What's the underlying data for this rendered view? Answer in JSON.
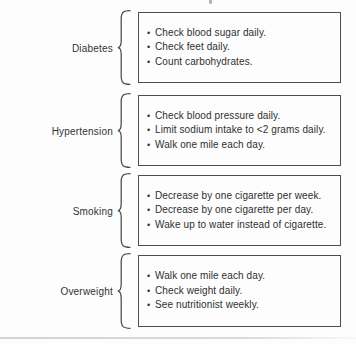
{
  "figure": {
    "sections": [
      {
        "label": "Diabetes",
        "items": [
          "Check blood sugar daily.",
          "Check feet daily.",
          "Count carbohydrates."
        ]
      },
      {
        "label": "Hypertension",
        "items": [
          "Check blood pressure daily.",
          "Limit sodium intake to <2 grams daily.",
          "Walk one mile each day."
        ]
      },
      {
        "label": "Smoking",
        "items": [
          "Decrease by one cigarette per week.",
          "Decrease by one cigarette per day.",
          "Wake up to water instead of cigarette."
        ]
      },
      {
        "label": "Overweight",
        "items": [
          "Walk one mile each day.",
          "Check weight daily.",
          "See nutritionist weekly."
        ]
      }
    ],
    "bullet_glyph": "•",
    "colors": {
      "box_border": "#4d4d4d",
      "brace": "#4a4a4a",
      "text": "#2f2f2f",
      "background": "#fdfdfd",
      "bottom_rule": "#d6d6d6"
    }
  }
}
